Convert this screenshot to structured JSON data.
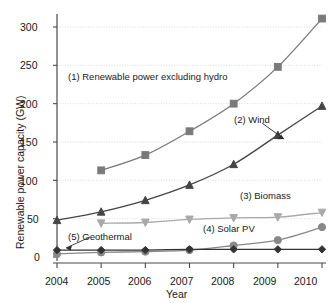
{
  "chart_data": {
    "type": "line",
    "title": "",
    "xlabel": "Year",
    "ylabel": "Renewable power capacity (GW)",
    "categories": [
      2004,
      2005,
      2006,
      2007,
      2008,
      2009,
      2010
    ],
    "xtick_labels": [
      "2004",
      "2005",
      "2006",
      "2007",
      "2008",
      "2009",
      "2010"
    ],
    "ytick_labels": [
      "0",
      "50",
      "100",
      "150",
      "200",
      "250",
      "300"
    ],
    "yticks": [
      0,
      50,
      100,
      150,
      200,
      250,
      300
    ],
    "ylim": [
      0,
      320
    ],
    "xlim": [
      2004,
      2010
    ],
    "grid": true,
    "grid_style": "dotted-horizontal",
    "legend": "inline-annotations",
    "series": [
      {
        "name": "(1) Renewable power excluding hydro",
        "marker": "square",
        "color": "#7a7a7a",
        "values": [
          null,
          113,
          133,
          164,
          200,
          248,
          311
        ]
      },
      {
        "name": "(2) Wind",
        "marker": "triangle-up",
        "color": "#454545",
        "values": [
          48,
          59,
          74,
          94,
          121,
          159,
          197
        ]
      },
      {
        "name": "(3) Biomass",
        "marker": "triangle-down",
        "color": "#a9a9a9",
        "values": [
          null,
          44,
          45,
          49,
          51,
          52,
          58
        ]
      },
      {
        "name": "(4) Solar PV",
        "marker": "circle",
        "color": "#888888",
        "values": [
          4,
          6,
          7,
          9,
          15,
          22,
          39
        ]
      },
      {
        "name": "(5) Geothermal",
        "marker": "diamond",
        "color": "#333333",
        "values": [
          9,
          9,
          9,
          10,
          10,
          10,
          10
        ]
      }
    ],
    "annotations": [
      {
        "id": "ann-1",
        "text": "(1) Renewable power excluding hydro",
        "x": 68,
        "y": 76
      },
      {
        "id": "ann-2",
        "text": "(2) Wind",
        "x": 234,
        "y": 119
      },
      {
        "id": "ann-3",
        "text": "(3) Biomass",
        "x": 240,
        "y": 195
      },
      {
        "id": "ann-4",
        "text": "(4) Solar PV",
        "x": 203,
        "y": 228
      },
      {
        "id": "ann-5",
        "text": "(5) Geothermal",
        "x": 68,
        "y": 236
      }
    ]
  }
}
